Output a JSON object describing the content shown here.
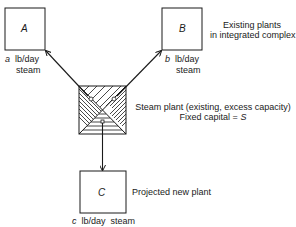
{
  "nodes": {
    "A": {
      "label": "A",
      "flow_var": "a",
      "flow_unit": "lb/day",
      "flow_unit2": "steam"
    },
    "B": {
      "label": "B",
      "flow_var": "b",
      "flow_unit": "lb/day",
      "flow_unit2": "steam"
    },
    "C": {
      "label": "C",
      "flow_var": "c",
      "flow_unit": "lb/day  steam",
      "description": "Projected new plant"
    }
  },
  "existing_plants_caption": {
    "line1": "Existing plants",
    "line2": "in integrated complex"
  },
  "steam_plant": {
    "line1": "Steam plant (existing, excess capacity)",
    "line2_prefix": "Fixed capital = ",
    "line2_var": "S"
  },
  "edges": [
    {
      "from": "steam_plant",
      "to": "A"
    },
    {
      "from": "steam_plant",
      "to": "B"
    },
    {
      "from": "steam_plant",
      "to": "C"
    }
  ],
  "colors": {
    "stroke": "#1a1a1a",
    "background": "#ffffff"
  }
}
